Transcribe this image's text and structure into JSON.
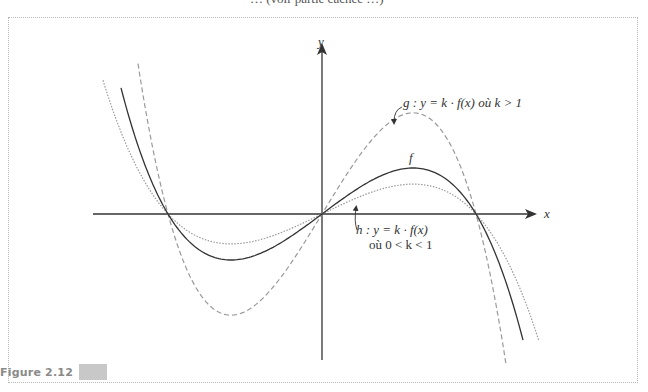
{
  "page": {
    "top_text_fragment": "… (voir partie cachée …)",
    "figure_label": "Figure 2.12"
  },
  "axes": {
    "x_label": "x",
    "y_label": "y"
  },
  "labels": {
    "f": "f",
    "g": "g : y = k · f(x)  où k > 1",
    "h_line1": "h : y = k · f(x)",
    "h_line2": "où 0 < k < 1"
  },
  "chart_data": {
    "type": "line",
    "title": "",
    "xlabel": "x",
    "ylabel": "y",
    "grid": false,
    "origin_px": [
      322,
      214
    ],
    "root_px": 154,
    "model": {
      "c1": 3.15e-05,
      "c2": 1.51e-10
    },
    "series": [
      {
        "name": "f",
        "k": 1.0,
        "style": "solid",
        "color": "#333333",
        "x_range_px": [
          -201,
          201
        ]
      },
      {
        "name": "g",
        "k": 2.2,
        "style": "dashed",
        "color": "#9a9a9a",
        "x_range_px": [
          -184,
          185
        ]
      },
      {
        "name": "h",
        "k": 0.65,
        "style": "dotted",
        "color": "#9a9a9a",
        "x_range_px": [
          -219,
          218
        ]
      }
    ],
    "annotations": [
      "f",
      "g : y = k · f(x) où k > 1",
      "h : y = k · f(x) où 0 < k < 1"
    ]
  }
}
